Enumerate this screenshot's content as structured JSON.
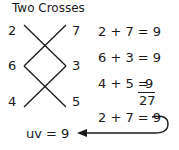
{
  "title": "Two Crosses",
  "cross_numbers": {
    "top_left": "2",
    "top_right": "7",
    "mid_left": "6",
    "mid_right": "3",
    "bottom_left": "4",
    "bottom_right": "5"
  },
  "equations": [
    "2 + 7 =  9",
    "6 + 3 =  9",
    "4 + 5 = "
  ],
  "sum_last": "9",
  "total": "27",
  "final_equation": "2 + 7 =  9",
  "result": "uv = 9"
}
